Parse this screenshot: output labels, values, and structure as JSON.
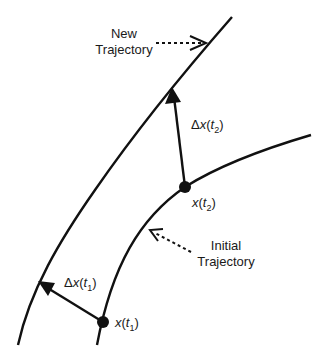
{
  "diagram": {
    "labels": {
      "new_trajectory": [
        "New",
        "Trajectory"
      ],
      "initial_trajectory": [
        "Initial",
        "Trajectory"
      ],
      "delta_t2": {
        "delta": "Δ",
        "var": "x",
        "open": "(",
        "t": "t",
        "sub": "2",
        "close": ")"
      },
      "delta_t1": {
        "delta": "Δ",
        "var": "x",
        "open": "(",
        "t": "t",
        "sub": "1",
        "close": ")"
      },
      "point_t2": {
        "var": "x",
        "open": "(",
        "t": "t",
        "sub": "2",
        "close": ")"
      },
      "point_t1": {
        "var": "x",
        "open": "(",
        "t": "t",
        "sub": "1",
        "close": ")"
      }
    },
    "colors": {
      "stroke": "#111111",
      "background": "#ffffff"
    }
  }
}
